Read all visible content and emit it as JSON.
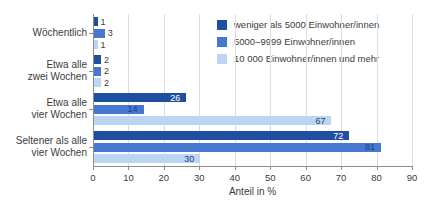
{
  "chart_data": {
    "type": "bar",
    "orientation": "horizontal",
    "title": "",
    "xlabel": "Anteil in %",
    "ylabel": "",
    "xlim": [
      0,
      90
    ],
    "xticks": [
      0,
      10,
      20,
      30,
      40,
      50,
      60,
      70,
      80,
      90
    ],
    "xticklabels": [
      "0",
      "10",
      "20",
      "30",
      "40",
      "50",
      "60",
      "70",
      "80",
      "90"
    ],
    "grid": "vertical",
    "legend_position": "top-right",
    "categories": [
      "Wöchentlich",
      "Etwa alle\nzwei Wochen",
      "Etwa alle\nvier Wochen",
      "Seltener als alle\nvier Wochen"
    ],
    "series": [
      {
        "name": "weniger als 5000 Einwohner/innen",
        "color": "#1f4fa0",
        "values": [
          1,
          2,
          26,
          72
        ],
        "labels": [
          "1",
          "2",
          "26",
          "72"
        ]
      },
      {
        "name": "5000–9999 Einwohner/innen",
        "color": "#4678d0",
        "values": [
          3,
          2,
          14,
          81
        ],
        "labels": [
          "3",
          "2",
          "14",
          "81"
        ]
      },
      {
        "name": "10 000 Einwohner/innen und mehr",
        "color": "#bcd5f2",
        "values": [
          1,
          2,
          67,
          30
        ],
        "labels": [
          "1",
          "2",
          "67",
          "30"
        ]
      }
    ]
  },
  "legend": {
    "items": [
      {
        "label": "weniger als 5000 Einwohner/innen",
        "color": "#1f4fa0"
      },
      {
        "label": "5000–9999 Einwohner/innen",
        "color": "#4678d0"
      },
      {
        "label": "10 000 Einwohner/innen und mehr",
        "color": "#bcd5f2"
      }
    ]
  },
  "axis": {
    "x_title": "Anteil in %"
  },
  "colors": {
    "series_dark": "#1f4fa0",
    "series_medium": "#4678d0",
    "series_light": "#bcd5f2",
    "axis": "#8c8c8c",
    "gridline": "#d8dde6",
    "text": "#3c3c3c",
    "label_on_light": "#1b3f86",
    "background": "#ffffff"
  }
}
